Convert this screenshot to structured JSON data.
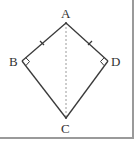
{
  "figure": {
    "type": "kite quadrilateral",
    "points": {
      "A": {
        "label": "A",
        "x": 66,
        "y": 23
      },
      "B": {
        "label": "B",
        "x": 22,
        "y": 61
      },
      "C": {
        "label": "C",
        "x": 66,
        "y": 118
      },
      "D": {
        "label": "D",
        "x": 108,
        "y": 61
      }
    },
    "segments": [
      {
        "from": "A",
        "to": "B",
        "style": "solid",
        "tick": true
      },
      {
        "from": "A",
        "to": "D",
        "style": "solid",
        "tick": true
      },
      {
        "from": "B",
        "to": "C",
        "style": "solid",
        "tick": false
      },
      {
        "from": "D",
        "to": "C",
        "style": "solid",
        "tick": false
      },
      {
        "from": "A",
        "to": "C",
        "style": "dashed",
        "tick": false
      }
    ],
    "right_angles": [
      "B",
      "D"
    ],
    "colors": {
      "line": "#3a3a3a",
      "dashed": "#9a9a9a",
      "frame": "#9a9a9a",
      "text": "#333333"
    }
  }
}
